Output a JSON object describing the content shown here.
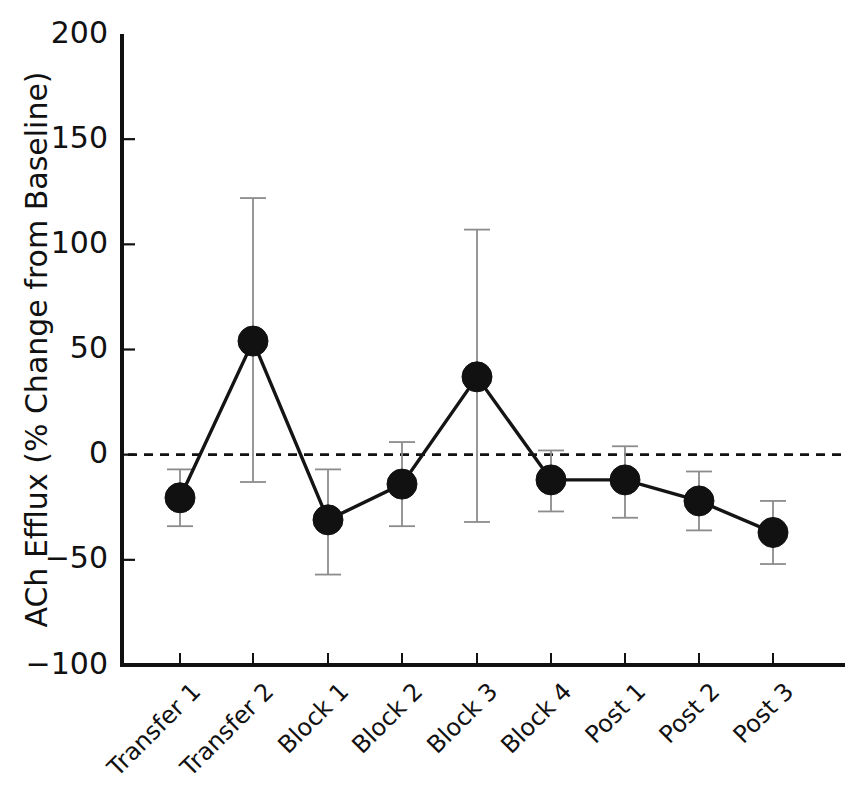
{
  "figure": {
    "width": 860,
    "height": 786,
    "background": "#ffffff",
    "caption_fragment": ""
  },
  "chart_data": {
    "type": "line",
    "title": "",
    "subtitle": "",
    "xlabel": "",
    "ylabel": "ACh Efflux (% Change from Baseline)",
    "categories": [
      "Transfer 1",
      "Transfer 2",
      "Block 1",
      "Block 2",
      "Block 3",
      "Block 4",
      "Post 1",
      "Post 2",
      "Post 3"
    ],
    "values": [
      -20.5,
      54.0,
      -31.0,
      -14.0,
      37.0,
      -12.0,
      -12.0,
      -22.0,
      -37.0
    ],
    "errors_upper": [
      13.5,
      68.0,
      24.0,
      20.0,
      70.0,
      14.0,
      16.0,
      14.0,
      15.0
    ],
    "errors_lower": [
      13.5,
      67.0,
      26.0,
      20.0,
      69.0,
      15.0,
      18.0,
      14.0,
      15.0
    ],
    "error_type": "SEM",
    "ylim": [
      -100,
      200
    ],
    "yticks": [
      200,
      150,
      100,
      50,
      0,
      -50,
      -100
    ],
    "ytick_labels": [
      "200",
      "150",
      "100",
      "50",
      "0",
      "−50",
      "−100"
    ],
    "grid": false,
    "legend": null,
    "reference_line": {
      "y": 0,
      "style": "dashed",
      "color": "#111111"
    },
    "marker": {
      "shape": "circle",
      "color": "#111111",
      "size": 15
    },
    "line_color": "#111111",
    "errorbar_color": "#8c8c8c",
    "xtick_rotation": -45
  },
  "axes": {
    "left_spine_x": 122,
    "bottom_spine_y": 665,
    "plot_right_x": 845,
    "plot_top_y": 34,
    "tick_positions_x": [
      180,
      253,
      328,
      402,
      477,
      551,
      625,
      699,
      773
    ]
  }
}
